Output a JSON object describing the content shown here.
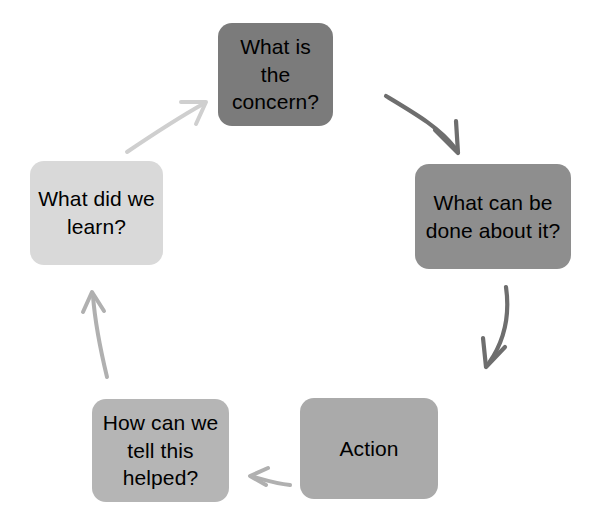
{
  "diagram": {
    "background_color": "#ffffff",
    "text_color": "#000000",
    "nodes": [
      {
        "id": "concern",
        "label": "What is the\nconcern?",
        "color": "#7b7b7b",
        "order": 1
      },
      {
        "id": "what-can-be-done",
        "label": "What can be\ndone about it?",
        "color": "#8e8e8e",
        "order": 2
      },
      {
        "id": "action",
        "label": "Action",
        "color": "#aaaaaa",
        "order": 3
      },
      {
        "id": "how-tell",
        "label": "How can we\ntell this\nhelped?",
        "color": "#b5b5b5",
        "order": 4
      },
      {
        "id": "learn",
        "label": "What did we\nlearn?",
        "color": "#d9d9d9",
        "order": 5
      }
    ],
    "arrows": [
      {
        "id": "concern-to-what-can-be-done",
        "from": "concern",
        "to": "what-can-be-done",
        "color": "#6e6e6e",
        "direction": "down-right"
      },
      {
        "id": "what-can-be-done-to-action",
        "from": "what-can-be-done",
        "to": "action",
        "color": "#6e6e6e",
        "direction": "down-left"
      },
      {
        "id": "action-to-how-tell",
        "from": "action",
        "to": "how-tell",
        "color": "#b0b0b0",
        "direction": "left"
      },
      {
        "id": "how-tell-to-learn",
        "from": "how-tell",
        "to": "learn",
        "color": "#b0b0b0",
        "direction": "up"
      },
      {
        "id": "learn-to-concern",
        "from": "learn",
        "to": "concern",
        "color": "#cfcfcf",
        "direction": "up-right"
      }
    ]
  }
}
